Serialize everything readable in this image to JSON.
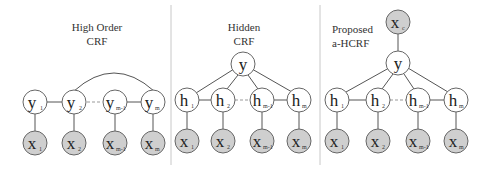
{
  "panels": [
    {
      "title_lines": [
        "High Order",
        "CRF"
      ],
      "hidden": [
        {
          "label": "y",
          "sub": "1"
        },
        {
          "label": "y",
          "sub": "2"
        },
        {
          "label": "y",
          "sub": "m-1"
        },
        {
          "label": "y",
          "sub": "m"
        }
      ],
      "observed": [
        {
          "label": "x",
          "sub": "1"
        },
        {
          "label": "x",
          "sub": "2"
        },
        {
          "label": "x",
          "sub": "m-1"
        },
        {
          "label": "x",
          "sub": "m"
        }
      ],
      "arc": "y2 to ym"
    },
    {
      "title_lines": [
        "Hidden",
        "CRF"
      ],
      "top": {
        "label": "y"
      },
      "hidden": [
        {
          "label": "h",
          "sub": "1"
        },
        {
          "label": "h",
          "sub": "2"
        },
        {
          "label": "h",
          "sub": "m-1"
        },
        {
          "label": "h",
          "sub": "m"
        }
      ],
      "observed": [
        {
          "label": "x",
          "sub": "1"
        },
        {
          "label": "x",
          "sub": "2"
        },
        {
          "label": "x",
          "sub": "m-1"
        },
        {
          "label": "x",
          "sub": "m"
        }
      ]
    },
    {
      "title_lines": [
        "Proposed",
        "a-HCRF"
      ],
      "context": {
        "label": "x",
        "sub": "c"
      },
      "top": {
        "label": "y"
      },
      "hidden": [
        {
          "label": "h",
          "sub": "1"
        },
        {
          "label": "h",
          "sub": "2"
        },
        {
          "label": "h",
          "sub": "m-1"
        },
        {
          "label": "h",
          "sub": "m"
        }
      ],
      "observed": [
        {
          "label": "x",
          "sub": "1"
        },
        {
          "label": "x",
          "sub": "2"
        },
        {
          "label": "x",
          "sub": "m-1"
        },
        {
          "label": "x",
          "sub": "m"
        }
      ]
    }
  ],
  "colors": {
    "observed_fill": "#cfcfcf",
    "hidden_fill": "#ffffff",
    "stroke": "#666666"
  }
}
